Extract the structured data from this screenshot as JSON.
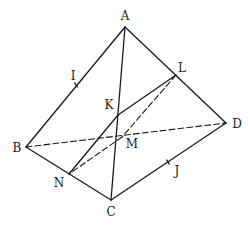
{
  "diagram": {
    "type": "tetrahedron",
    "stroke_color": "#1a1a1a",
    "background": "#ffffff",
    "points": {
      "A": {
        "label": "A",
        "x": 125,
        "y": 27,
        "lx": 125,
        "ly": 20
      },
      "B": {
        "label": "B",
        "x": 26,
        "y": 147,
        "lx": 17,
        "ly": 152
      },
      "C": {
        "label": "C",
        "x": 111,
        "y": 200,
        "lx": 111,
        "ly": 216
      },
      "D": {
        "label": "D",
        "x": 226,
        "y": 123,
        "lx": 237,
        "ly": 128
      },
      "I": {
        "label": "I",
        "x": 76,
        "y": 85,
        "lx": 73,
        "ly": 80
      },
      "J": {
        "label": "J",
        "x": 168,
        "y": 162,
        "lx": 177,
        "ly": 175
      },
      "K": {
        "label": "K",
        "x": 118,
        "y": 115,
        "lx": 109,
        "ly": 109
      },
      "L": {
        "label": "L",
        "x": 176,
        "y": 75,
        "lx": 182,
        "ly": 72
      },
      "M": {
        "label": "M",
        "x": 122,
        "y": 137,
        "lx": 132,
        "ly": 148
      },
      "N": {
        "label": "N",
        "x": 69,
        "y": 174,
        "lx": 59,
        "ly": 187
      }
    },
    "solid_edges": [
      [
        "A",
        "B"
      ],
      [
        "A",
        "C"
      ],
      [
        "A",
        "D"
      ],
      [
        "B",
        "C"
      ],
      [
        "C",
        "D"
      ],
      [
        "K",
        "L"
      ],
      [
        "K",
        "N"
      ]
    ],
    "dashed_edges": [
      [
        "B",
        "D"
      ],
      [
        "L",
        "M"
      ],
      [
        "M",
        "N"
      ]
    ],
    "tick_marks": [
      "I",
      "J"
    ]
  }
}
